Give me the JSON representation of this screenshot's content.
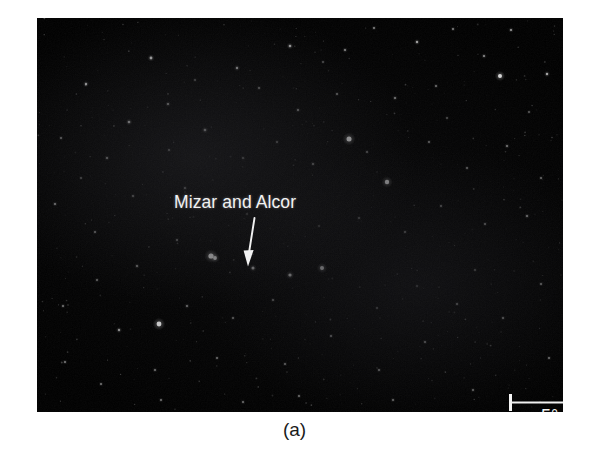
{
  "figure": {
    "caption": "(a)",
    "photo": {
      "background_color": "#000000",
      "subject": "night-sky-star-field"
    }
  },
  "annotations": {
    "star_label": {
      "text": "Mizar and Alcor",
      "color": "#f2f2f2",
      "pointer_icon": "down-arrow-icon"
    },
    "scale_bar": {
      "label": "5°",
      "color": "#f5f5f5",
      "length_px": 76,
      "represents_degrees": 5
    }
  },
  "chart_data": {
    "type": "scatter",
    "title": "Mizar and Alcor",
    "subtitle": "(a)",
    "xlabel": "",
    "ylabel": "",
    "xlim": [
      0,
      526
    ],
    "ylim": [
      0,
      394
    ],
    "grid": false,
    "legend": null,
    "annotations": [
      {
        "text": "Mizar and Alcor",
        "x": 100,
        "y": 160,
        "points_to": [
          174,
          238
        ]
      },
      {
        "text": "5°",
        "x": 467,
        "y": 372,
        "scale_bar_px": 76
      }
    ],
    "series": [
      {
        "name": "stars",
        "note": "x,y are pixel positions inside the 526x394 plate; r = rendered radius px; b = brightness 0-1",
        "points": [
          {
            "x": 174,
            "y": 238,
            "r": 2.6,
            "b": 1.0
          },
          {
            "x": 178,
            "y": 240,
            "r": 1.9,
            "b": 0.92
          },
          {
            "x": 122,
            "y": 306,
            "r": 2.4,
            "b": 0.97
          },
          {
            "x": 312,
            "y": 121,
            "r": 2.5,
            "b": 0.98
          },
          {
            "x": 463,
            "y": 58,
            "r": 2.0,
            "b": 0.88
          },
          {
            "x": 350,
            "y": 164,
            "r": 2.2,
            "b": 0.93
          },
          {
            "x": 285,
            "y": 250,
            "r": 2.0,
            "b": 0.9
          },
          {
            "x": 253,
            "y": 257,
            "r": 1.6,
            "b": 0.8
          },
          {
            "x": 216,
            "y": 250,
            "r": 1.5,
            "b": 0.74
          },
          {
            "x": 114,
            "y": 40,
            "r": 1.4,
            "b": 0.7
          },
          {
            "x": 49,
            "y": 66,
            "r": 1.2,
            "b": 0.62
          },
          {
            "x": 92,
            "y": 104,
            "r": 1.3,
            "b": 0.66
          },
          {
            "x": 131,
            "y": 86,
            "r": 1.1,
            "b": 0.55
          },
          {
            "x": 200,
            "y": 50,
            "r": 1.2,
            "b": 0.58
          },
          {
            "x": 253,
            "y": 28,
            "r": 1.3,
            "b": 0.64
          },
          {
            "x": 308,
            "y": 32,
            "r": 1.1,
            "b": 0.52
          },
          {
            "x": 337,
            "y": 10,
            "r": 1.0,
            "b": 0.48
          },
          {
            "x": 380,
            "y": 24,
            "r": 1.2,
            "b": 0.6
          },
          {
            "x": 416,
            "y": 11,
            "r": 1.0,
            "b": 0.46
          },
          {
            "x": 474,
            "y": 12,
            "r": 1.1,
            "b": 0.52
          },
          {
            "x": 510,
            "y": 56,
            "r": 1.2,
            "b": 0.58
          },
          {
            "x": 447,
            "y": 38,
            "r": 1.1,
            "b": 0.5
          },
          {
            "x": 399,
            "y": 68,
            "r": 1.0,
            "b": 0.46
          },
          {
            "x": 358,
            "y": 80,
            "r": 1.1,
            "b": 0.52
          },
          {
            "x": 300,
            "y": 76,
            "r": 1.0,
            "b": 0.44
          },
          {
            "x": 261,
            "y": 92,
            "r": 1.1,
            "b": 0.5
          },
          {
            "x": 222,
            "y": 70,
            "r": 1.0,
            "b": 0.44
          },
          {
            "x": 168,
            "y": 112,
            "r": 1.3,
            "b": 0.62
          },
          {
            "x": 132,
            "y": 132,
            "r": 1.0,
            "b": 0.46
          },
          {
            "x": 70,
            "y": 140,
            "r": 1.1,
            "b": 0.5
          },
          {
            "x": 24,
            "y": 120,
            "r": 1.0,
            "b": 0.42
          },
          {
            "x": 18,
            "y": 186,
            "r": 1.1,
            "b": 0.5
          },
          {
            "x": 58,
            "y": 214,
            "r": 1.0,
            "b": 0.44
          },
          {
            "x": 96,
            "y": 178,
            "r": 1.0,
            "b": 0.44
          },
          {
            "x": 148,
            "y": 170,
            "r": 1.1,
            "b": 0.48
          },
          {
            "x": 206,
            "y": 140,
            "r": 1.0,
            "b": 0.44
          },
          {
            "x": 240,
            "y": 124,
            "r": 1.0,
            "b": 0.42
          },
          {
            "x": 276,
            "y": 146,
            "r": 1.1,
            "b": 0.5
          },
          {
            "x": 330,
            "y": 134,
            "r": 1.0,
            "b": 0.42
          },
          {
            "x": 392,
            "y": 124,
            "r": 1.0,
            "b": 0.44
          },
          {
            "x": 430,
            "y": 150,
            "r": 1.0,
            "b": 0.44
          },
          {
            "x": 470,
            "y": 128,
            "r": 1.1,
            "b": 0.48
          },
          {
            "x": 504,
            "y": 160,
            "r": 1.0,
            "b": 0.42
          },
          {
            "x": 490,
            "y": 198,
            "r": 1.1,
            "b": 0.5
          },
          {
            "x": 448,
            "y": 206,
            "r": 1.0,
            "b": 0.44
          },
          {
            "x": 404,
            "y": 188,
            "r": 1.0,
            "b": 0.42
          },
          {
            "x": 368,
            "y": 214,
            "r": 1.0,
            "b": 0.44
          },
          {
            "x": 322,
            "y": 200,
            "r": 1.0,
            "b": 0.42
          },
          {
            "x": 140,
            "y": 222,
            "r": 1.0,
            "b": 0.44
          },
          {
            "x": 100,
            "y": 248,
            "r": 1.1,
            "b": 0.48
          },
          {
            "x": 60,
            "y": 262,
            "r": 1.0,
            "b": 0.42
          },
          {
            "x": 26,
            "y": 288,
            "r": 1.0,
            "b": 0.44
          },
          {
            "x": 82,
            "y": 312,
            "r": 1.2,
            "b": 0.56
          },
          {
            "x": 150,
            "y": 288,
            "r": 1.1,
            "b": 0.48
          },
          {
            "x": 196,
            "y": 300,
            "r": 1.0,
            "b": 0.44
          },
          {
            "x": 236,
            "y": 282,
            "r": 1.0,
            "b": 0.42
          },
          {
            "x": 180,
            "y": 340,
            "r": 1.0,
            "b": 0.44
          },
          {
            "x": 118,
            "y": 352,
            "r": 1.0,
            "b": 0.42
          },
          {
            "x": 64,
            "y": 366,
            "r": 1.0,
            "b": 0.4
          },
          {
            "x": 28,
            "y": 344,
            "r": 1.0,
            "b": 0.42
          },
          {
            "x": 248,
            "y": 346,
            "r": 1.0,
            "b": 0.42
          },
          {
            "x": 294,
            "y": 318,
            "r": 1.0,
            "b": 0.44
          },
          {
            "x": 342,
            "y": 352,
            "r": 1.0,
            "b": 0.42
          },
          {
            "x": 388,
            "y": 324,
            "r": 1.0,
            "b": 0.42
          },
          {
            "x": 420,
            "y": 286,
            "r": 1.0,
            "b": 0.44
          },
          {
            "x": 466,
            "y": 300,
            "r": 1.0,
            "b": 0.42
          },
          {
            "x": 504,
            "y": 266,
            "r": 1.0,
            "b": 0.44
          },
          {
            "x": 512,
            "y": 340,
            "r": 1.0,
            "b": 0.4
          },
          {
            "x": 262,
            "y": 378,
            "r": 1.0,
            "b": 0.42
          },
          {
            "x": 206,
            "y": 384,
            "r": 1.0,
            "b": 0.4
          },
          {
            "x": 124,
            "y": 382,
            "r": 1.0,
            "b": 0.4
          },
          {
            "x": 356,
            "y": 382,
            "r": 1.0,
            "b": 0.4
          },
          {
            "x": 436,
            "y": 372,
            "r": 1.0,
            "b": 0.38
          },
          {
            "x": 380,
            "y": 268,
            "r": 0.9,
            "b": 0.36
          },
          {
            "x": 340,
            "y": 290,
            "r": 0.9,
            "b": 0.36
          },
          {
            "x": 282,
            "y": 208,
            "r": 0.9,
            "b": 0.36
          },
          {
            "x": 44,
            "y": 160,
            "r": 0.9,
            "b": 0.34
          },
          {
            "x": 210,
            "y": 196,
            "r": 0.9,
            "b": 0.34
          },
          {
            "x": 438,
            "y": 252,
            "r": 0.9,
            "b": 0.36
          },
          {
            "x": 158,
            "y": 62,
            "r": 0.9,
            "b": 0.34
          },
          {
            "x": 286,
            "y": 44,
            "r": 0.9,
            "b": 0.34
          },
          {
            "x": 492,
            "y": 94,
            "r": 0.9,
            "b": 0.36
          },
          {
            "x": 410,
            "y": 100,
            "r": 0.9,
            "b": 0.34
          }
        ]
      }
    ]
  }
}
